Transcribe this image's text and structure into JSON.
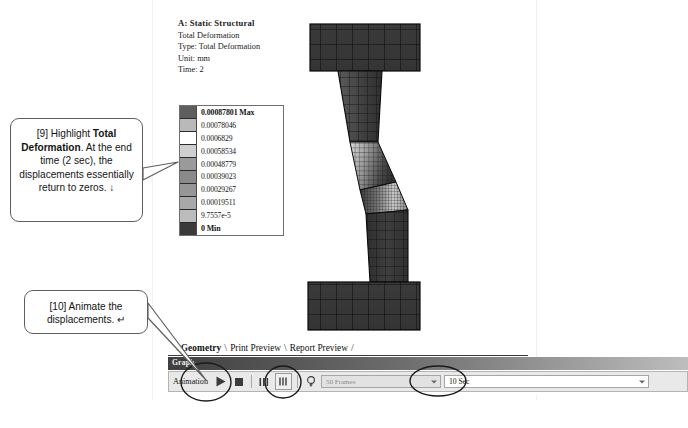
{
  "result_header": {
    "title": "A: Static Structural",
    "line2": "Total Deformation",
    "line3": "Type: Total Deformation",
    "line4": "Unit: mm",
    "line5": "Time: 2"
  },
  "legend": {
    "name": "contour-legend",
    "unit": "mm",
    "max_label": "0.00087801 Max",
    "min_label": "0 Min",
    "values": [
      "0.00087801 Max",
      "0.00078046",
      "0.0006829",
      "0.00058534",
      "0.00048779",
      "0.00039023",
      "0.00029267",
      "0.00019511",
      "9.7557e-5",
      "0 Min"
    ],
    "swatch_colors": [
      "#5e5e5e",
      "#b9b9b9",
      "#ffffff",
      "#cfcfcf",
      "#9a9a9a",
      "#8a8a8a",
      "#969696",
      "#a8a8a8",
      "#bcbcbc",
      "#3a3a3a"
    ]
  },
  "model": {
    "name": "finite-element-mesh-view",
    "description": "Deformed Z-shaped specimen mesh, Total Deformation contour"
  },
  "tabs": {
    "items": [
      {
        "label": "Geometry",
        "active": true
      },
      {
        "label": "Print Preview",
        "active": false
      },
      {
        "label": "Report Preview",
        "active": false
      }
    ],
    "separator": "\\"
  },
  "graph_panel": {
    "title": "Graph",
    "animation_label": "Animation",
    "buttons": [
      {
        "name": "play-button",
        "icon": "play-icon"
      },
      {
        "name": "stop-button",
        "icon": "stop-icon"
      },
      {
        "name": "distribute-frames-button",
        "icon": "frames-columns-icon"
      },
      {
        "name": "single-frame-button",
        "icon": "single-column-icon"
      },
      {
        "name": "bulb-button",
        "icon": "lightbulb-icon"
      }
    ],
    "frames_value": "50 Frames",
    "duration_value": "10 Sec"
  },
  "callouts": [
    {
      "id": "callout-9",
      "prefix": "[9] Highlight ",
      "bold": "Total Deformation",
      "suffix": ". At the end time (2 sec), the displacements essentially return to zeros. ",
      "arrow": "↓"
    },
    {
      "id": "callout-10",
      "text": "[10] Animate the displacements. ",
      "arrow": "↵"
    }
  ],
  "annotation_marks": {
    "play_circle": "ellipse-highlight-play",
    "frame_circle": "ellipse-highlight-frame-button",
    "duration_circle": "ellipse-highlight-duration"
  }
}
